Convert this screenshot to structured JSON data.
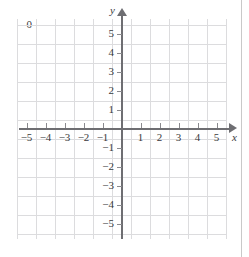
{
  "figure": {
    "type": "cartesian-coordinate-plane",
    "title": "",
    "axes": {
      "x": {
        "name": "x",
        "min": -6,
        "max": 6,
        "tick_step": 1,
        "tick_labels": [
          "-5",
          "-4",
          "-3",
          "-2",
          "-1",
          "1",
          "2",
          "3",
          "4",
          "5"
        ],
        "tick_values": [
          -5,
          -4,
          -3,
          -2,
          -1,
          1,
          2,
          3,
          4,
          5
        ],
        "arrow": "right"
      },
      "y": {
        "name": "y",
        "min": -6,
        "max": 6,
        "tick_step": 1,
        "tick_labels": [
          "5",
          "4",
          "3",
          "2",
          "1",
          "-1",
          "-2",
          "-3",
          "-4",
          "-5"
        ],
        "tick_values": [
          5,
          4,
          3,
          2,
          1,
          -1,
          -2,
          -3,
          -4,
          -5
        ],
        "arrow": "up"
      }
    },
    "origin_label": "0",
    "grid": {
      "visible": true,
      "step": 1,
      "color": "#dcdcde",
      "x_lines": [
        -5.5,
        -4.5,
        -3.5,
        -2.5,
        -1.5,
        -0.5,
        0.5,
        1.5,
        2.5,
        3.5,
        4.5,
        5.5
      ],
      "y_lines": [
        5.5,
        4.5,
        3.5,
        2.5,
        1.5,
        0.5,
        -0.5,
        -1.5,
        -2.5,
        -3.5,
        -4.5,
        -5.5
      ]
    },
    "colors": {
      "axis": "#6e6e72",
      "grid": "#dcdcde",
      "label": "#3a3a3c",
      "background": "#ffffff",
      "page_rule": "#c9c9c9"
    },
    "series": []
  },
  "chart_data": {
    "type": "scatter",
    "title": "",
    "xlabel": "x",
    "ylabel": "y",
    "xlim": [
      -6,
      6
    ],
    "ylim": [
      -6,
      6
    ],
    "xticks": [
      -5,
      -4,
      -3,
      -2,
      -1,
      0,
      1,
      2,
      3,
      4,
      5
    ],
    "yticks": [
      -5,
      -4,
      -3,
      -2,
      -1,
      0,
      1,
      2,
      3,
      4,
      5
    ],
    "grid": true,
    "legend": null,
    "series": [],
    "annotations": []
  }
}
